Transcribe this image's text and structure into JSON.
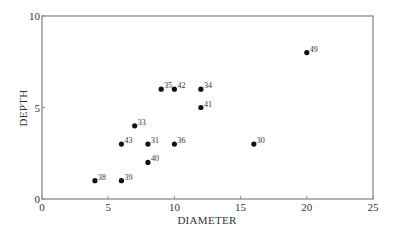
{
  "chart_data": {
    "type": "scatter",
    "title": "",
    "xlabel": "DIAMETER",
    "ylabel": "DEPTH",
    "xlim": [
      0,
      25
    ],
    "ylim": [
      0,
      10
    ],
    "xticks": [
      0,
      5,
      10,
      15,
      20,
      25
    ],
    "yticks": [
      0,
      5,
      10
    ],
    "grid": false,
    "legend": null,
    "points": [
      {
        "label": "38",
        "x": 4,
        "y": 1
      },
      {
        "label": "39",
        "x": 6,
        "y": 1
      },
      {
        "label": "43",
        "x": 6,
        "y": 3
      },
      {
        "label": "33",
        "x": 7,
        "y": 4
      },
      {
        "label": "31",
        "x": 8,
        "y": 3
      },
      {
        "label": "40",
        "x": 8,
        "y": 2
      },
      {
        "label": "36",
        "x": 10,
        "y": 3
      },
      {
        "label": "35",
        "x": 9,
        "y": 6
      },
      {
        "label": "42",
        "x": 10,
        "y": 6
      },
      {
        "label": "34",
        "x": 12,
        "y": 6
      },
      {
        "label": "41",
        "x": 12,
        "y": 5
      },
      {
        "label": "30",
        "x": 16,
        "y": 3
      },
      {
        "label": "49",
        "x": 20,
        "y": 8
      }
    ]
  },
  "colors": {
    "axis": "#8a8a8a",
    "point": "#111111",
    "text": "#333333"
  }
}
